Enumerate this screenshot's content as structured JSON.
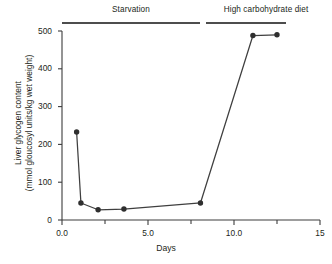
{
  "chart_data": {
    "type": "line",
    "title": "",
    "subtitle": "",
    "xlabel": "Days",
    "ylabel_line1": "Liver glycogen content",
    "ylabel_line2": "(mmol gloucosyl units/kg wet weight)",
    "xlim": [
      0,
      15
    ],
    "ylim": [
      0,
      500
    ],
    "grid": false,
    "legend": "none",
    "x_ticks_major": [
      "0.0",
      "5.0",
      "10.0",
      "15"
    ],
    "x_tick_major_values": [
      0,
      5,
      10,
      15
    ],
    "x_tick_minor_values": [
      2.5,
      7.5,
      12.5
    ],
    "y_ticks": [
      "0",
      "100",
      "200",
      "300",
      "400",
      "500"
    ],
    "y_tick_values": [
      0,
      100,
      200,
      300,
      400,
      500
    ],
    "series": [
      {
        "name": "Liver glycogen content",
        "marker": "filled-circle",
        "color": "#3f3f3f",
        "x": [
          0.85,
          1.1,
          2.1,
          3.6,
          8.05,
          11.1,
          12.5
        ],
        "y": [
          233,
          45,
          27,
          29,
          45,
          488,
          490
        ]
      }
    ],
    "annotations": [
      {
        "id": "starvation",
        "label": "Starvation",
        "x_start": 0,
        "x_end": 8.0,
        "style": "underline-bar"
      },
      {
        "id": "high-carbohydrate-diet",
        "label": "High carbohydrate diet",
        "x_start": 8.3,
        "x_end": 13.0,
        "style": "underline-bar"
      }
    ]
  }
}
